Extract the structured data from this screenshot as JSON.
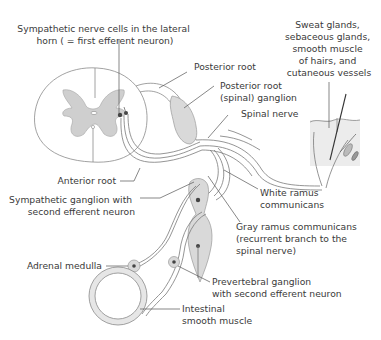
{
  "figure": {
    "type": "anatomical-diagram"
  },
  "labels": {
    "lateral_horn": [
      "Sympathetic nerve cells in the lateral",
      "horn ( = first efferent neuron)"
    ],
    "posterior_root": [
      "Posterior root"
    ],
    "posterior_root_ganglion": [
      "Posterior root",
      "(spinal) ganglion"
    ],
    "spinal_nerve": [
      "Spinal nerve"
    ],
    "skin_targets": [
      "Sweat glands,",
      "sebaceous glands,",
      "smooth muscle",
      "of hairs, and",
      "cutaneous vessels"
    ],
    "anterior_root": [
      "Anterior root"
    ],
    "sympathetic_ganglion": [
      "Sympathetic ganglion with",
      "second efferent neuron"
    ],
    "white_ramus": [
      "White ramus",
      "communicans"
    ],
    "gray_ramus": [
      "Gray ramus communicans",
      "(recurrent branch to the",
      "spinal nerve)"
    ],
    "adrenal_medulla": [
      "Adrenal medulla"
    ],
    "prevertebral_ganglion": [
      "Prevertebral ganglion",
      "with second efferent neuron"
    ],
    "intestinal_muscle": [
      "Intestinal",
      "smooth muscle"
    ]
  },
  "colors": {
    "gray_matter": "#cfcfcf",
    "outline": "#8a8a8a",
    "text": "#3a3a3a",
    "background": "#ffffff"
  }
}
